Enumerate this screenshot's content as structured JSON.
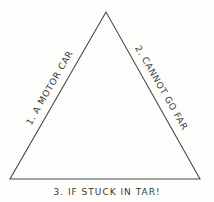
{
  "diagram": {
    "shape": "triangle",
    "stroke_color": "#4a4a4a",
    "vertices": {
      "apex": [
        106,
        12
      ],
      "bottom_left": [
        10,
        179
      ],
      "bottom_right": [
        200,
        179
      ]
    },
    "sides": [
      {
        "position": "left",
        "label": "1. A MOTOR CAR"
      },
      {
        "position": "right",
        "label": "2. CANNOT GO FAR"
      },
      {
        "position": "bottom",
        "label": "3. IF STUCK IN TAR!"
      }
    ]
  }
}
